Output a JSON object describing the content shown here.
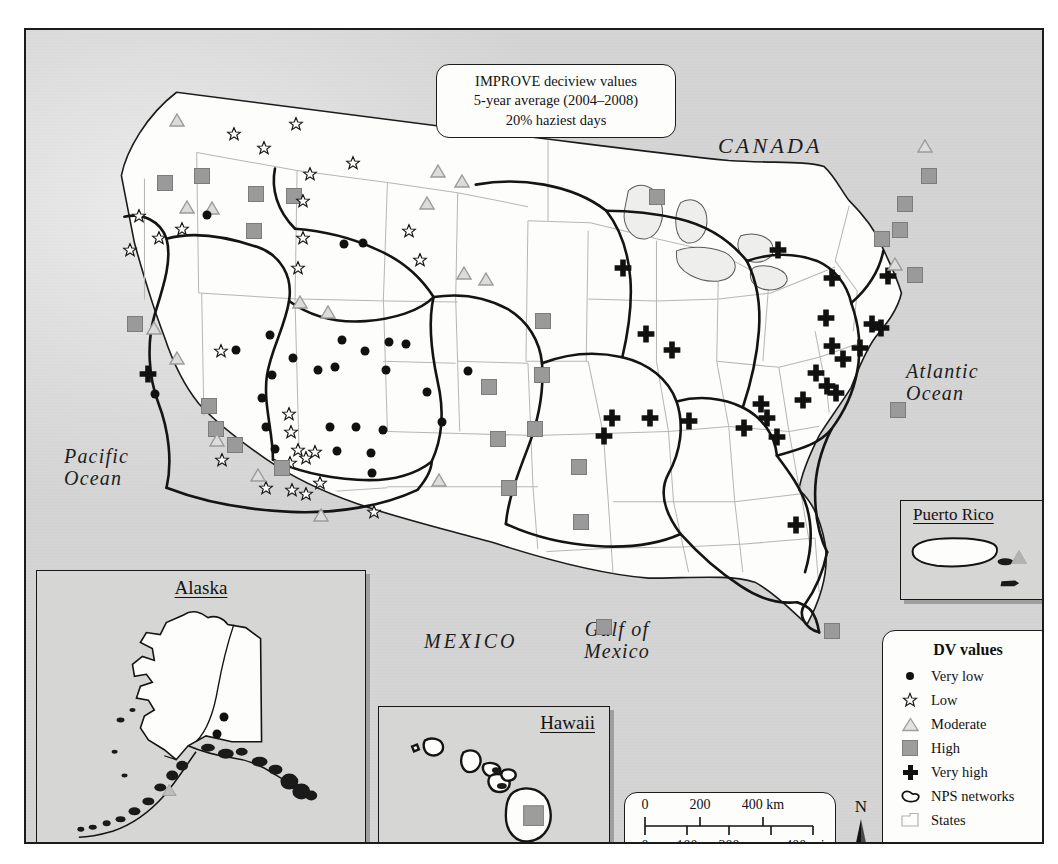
{
  "title_box": {
    "line1": "IMPROVE deciview values",
    "line2": "5-year average (2004–2008)",
    "line3": "20% haziest days"
  },
  "geo_labels": {
    "canada": "CANADA",
    "mexico": "MEXICO",
    "pacific_ocean": "Pacific\nOcean",
    "atlantic_ocean": "Atlantic\nOcean",
    "gulf_of_mexico": "Gulf of\nMexico"
  },
  "insets": {
    "alaska": {
      "title": "Alaska"
    },
    "hawaii": {
      "title": "Hawaii"
    },
    "puerto_rico": {
      "title": "Puerto Rico"
    }
  },
  "legend": {
    "title": "DV values",
    "items": [
      {
        "symbol": "dot-icon",
        "label": "Very low"
      },
      {
        "symbol": "star-icon",
        "label": "Low"
      },
      {
        "symbol": "triangle-icon",
        "label": "Moderate"
      },
      {
        "symbol": "square-icon",
        "label": "High"
      },
      {
        "symbol": "cross-icon",
        "label": "Very high"
      },
      {
        "symbol": "network-outline-icon",
        "label": "NPS networks"
      },
      {
        "symbol": "state-outline-icon",
        "label": "States"
      }
    ]
  },
  "scale_bar": {
    "km_ticks": [
      "0",
      "200",
      "400 km"
    ],
    "mi_ticks": [
      "0",
      "100",
      "200",
      "400 mi"
    ]
  },
  "north_arrow": {
    "label": "N"
  },
  "colors": {
    "very_low": "#111111",
    "low_outline": "#1a1a1a",
    "moderate": "#b2b2b2",
    "high": "#9a9a9a",
    "very_high": "#111111",
    "background": "#d8d8d6",
    "land": "#fdfdfc",
    "nps_network_line": "#151515",
    "state_line": "#b0b0ae"
  },
  "chart_data": {
    "type": "map",
    "categories": [
      "Very low",
      "Low",
      "Moderate",
      "High",
      "Very high"
    ],
    "markers": [
      {
        "c": "sq",
        "x": 139,
        "y": 153
      },
      {
        "c": "sq",
        "x": 176,
        "y": 146
      },
      {
        "c": "tri",
        "x": 151,
        "y": 92
      },
      {
        "c": "star",
        "x": 208,
        "y": 106
      },
      {
        "c": "star",
        "x": 238,
        "y": 120
      },
      {
        "c": "star",
        "x": 270,
        "y": 96
      },
      {
        "c": "star",
        "x": 327,
        "y": 135
      },
      {
        "c": "star",
        "x": 284,
        "y": 146
      },
      {
        "c": "tri",
        "x": 186,
        "y": 180
      },
      {
        "c": "dot",
        "x": 181,
        "y": 185
      },
      {
        "c": "sq",
        "x": 230,
        "y": 164
      },
      {
        "c": "sq",
        "x": 268,
        "y": 166
      },
      {
        "c": "star",
        "x": 277,
        "y": 173
      },
      {
        "c": "tri",
        "x": 412,
        "y": 143
      },
      {
        "c": "tri",
        "x": 436,
        "y": 153
      },
      {
        "c": "tri",
        "x": 401,
        "y": 175
      },
      {
        "c": "sq",
        "x": 228,
        "y": 201
      },
      {
        "c": "star",
        "x": 113,
        "y": 188
      },
      {
        "c": "star",
        "x": 104,
        "y": 222
      },
      {
        "c": "star",
        "x": 133,
        "y": 210
      },
      {
        "c": "tri",
        "x": 161,
        "y": 179
      },
      {
        "c": "star",
        "x": 156,
        "y": 201
      },
      {
        "c": "star",
        "x": 277,
        "y": 210
      },
      {
        "c": "star",
        "x": 272,
        "y": 240
      },
      {
        "c": "star",
        "x": 383,
        "y": 203
      },
      {
        "c": "tri",
        "x": 274,
        "y": 274
      },
      {
        "c": "tri",
        "x": 302,
        "y": 284
      },
      {
        "c": "star",
        "x": 394,
        "y": 232
      },
      {
        "c": "tri",
        "x": 438,
        "y": 245
      },
      {
        "c": "tri",
        "x": 460,
        "y": 251
      },
      {
        "c": "dot",
        "x": 318,
        "y": 214
      },
      {
        "c": "dot",
        "x": 337,
        "y": 213
      },
      {
        "c": "tri",
        "x": 128,
        "y": 300
      },
      {
        "c": "tri",
        "x": 151,
        "y": 330
      },
      {
        "c": "sq",
        "x": 109,
        "y": 294
      },
      {
        "c": "dot",
        "x": 129,
        "y": 364
      },
      {
        "c": "cross",
        "x": 122,
        "y": 346
      },
      {
        "c": "sq",
        "x": 183,
        "y": 376
      },
      {
        "c": "sq",
        "x": 190,
        "y": 399
      },
      {
        "c": "tri",
        "x": 191,
        "y": 412
      },
      {
        "c": "star",
        "x": 195,
        "y": 323
      },
      {
        "c": "dot",
        "x": 210,
        "y": 320
      },
      {
        "c": "dot",
        "x": 244,
        "y": 305
      },
      {
        "c": "dot",
        "x": 246,
        "y": 345
      },
      {
        "c": "dot",
        "x": 267,
        "y": 328
      },
      {
        "c": "dot",
        "x": 292,
        "y": 340
      },
      {
        "c": "dot",
        "x": 309,
        "y": 337
      },
      {
        "c": "dot",
        "x": 316,
        "y": 310
      },
      {
        "c": "dot",
        "x": 339,
        "y": 321
      },
      {
        "c": "dot",
        "x": 363,
        "y": 312
      },
      {
        "c": "dot",
        "x": 360,
        "y": 340
      },
      {
        "c": "dot",
        "x": 380,
        "y": 314
      },
      {
        "c": "star",
        "x": 263,
        "y": 386
      },
      {
        "c": "star",
        "x": 265,
        "y": 404
      },
      {
        "c": "star",
        "x": 272,
        "y": 422
      },
      {
        "c": "star",
        "x": 280,
        "y": 430
      },
      {
        "c": "star",
        "x": 289,
        "y": 424
      },
      {
        "c": "star",
        "x": 264,
        "y": 435
      },
      {
        "c": "sq",
        "x": 256,
        "y": 438
      },
      {
        "c": "star",
        "x": 240,
        "y": 460
      },
      {
        "c": "star",
        "x": 266,
        "y": 462
      },
      {
        "c": "star",
        "x": 280,
        "y": 466
      },
      {
        "c": "star",
        "x": 294,
        "y": 455
      },
      {
        "c": "dot",
        "x": 240,
        "y": 397
      },
      {
        "c": "dot",
        "x": 249,
        "y": 419
      },
      {
        "c": "dot",
        "x": 304,
        "y": 397
      },
      {
        "c": "dot",
        "x": 311,
        "y": 421
      },
      {
        "c": "dot",
        "x": 330,
        "y": 397
      },
      {
        "c": "dot",
        "x": 345,
        "y": 423
      },
      {
        "c": "dot",
        "x": 357,
        "y": 400
      },
      {
        "c": "dot",
        "x": 346,
        "y": 443
      },
      {
        "c": "star",
        "x": 348,
        "y": 484
      },
      {
        "c": "tri",
        "x": 295,
        "y": 487
      },
      {
        "c": "star",
        "x": 196,
        "y": 432
      },
      {
        "c": "sq",
        "x": 209,
        "y": 415
      },
      {
        "c": "tri",
        "x": 232,
        "y": 447
      },
      {
        "c": "dot",
        "x": 236,
        "y": 368
      },
      {
        "c": "dot",
        "x": 401,
        "y": 362
      },
      {
        "c": "dot",
        "x": 416,
        "y": 392
      },
      {
        "c": "tri",
        "x": 413,
        "y": 452
      },
      {
        "c": "dot",
        "x": 442,
        "y": 341
      },
      {
        "c": "sq",
        "x": 517,
        "y": 291
      },
      {
        "c": "sq",
        "x": 463,
        "y": 357
      },
      {
        "c": "sq",
        "x": 516,
        "y": 345
      },
      {
        "c": "sq",
        "x": 509,
        "y": 399
      },
      {
        "c": "sq",
        "x": 472,
        "y": 409
      },
      {
        "c": "sq",
        "x": 483,
        "y": 458
      },
      {
        "c": "sq",
        "x": 553,
        "y": 437
      },
      {
        "c": "sq",
        "x": 555,
        "y": 492
      },
      {
        "c": "sq",
        "x": 578,
        "y": 597
      },
      {
        "c": "sq",
        "x": 631,
        "y": 167
      },
      {
        "c": "cross",
        "x": 597,
        "y": 240
      },
      {
        "c": "cross",
        "x": 620,
        "y": 306
      },
      {
        "c": "cross",
        "x": 646,
        "y": 322
      },
      {
        "c": "cross",
        "x": 586,
        "y": 390
      },
      {
        "c": "cross",
        "x": 578,
        "y": 408
      },
      {
        "c": "cross",
        "x": 624,
        "y": 390
      },
      {
        "c": "cross",
        "x": 663,
        "y": 393
      },
      {
        "c": "cross",
        "x": 718,
        "y": 400
      },
      {
        "c": "cross",
        "x": 741,
        "y": 390
      },
      {
        "c": "cross",
        "x": 752,
        "y": 222
      },
      {
        "c": "cross",
        "x": 806,
        "y": 250
      },
      {
        "c": "cross",
        "x": 862,
        "y": 248
      },
      {
        "c": "cross",
        "x": 800,
        "y": 290
      },
      {
        "c": "cross",
        "x": 846,
        "y": 296
      },
      {
        "c": "cross",
        "x": 806,
        "y": 318
      },
      {
        "c": "cross",
        "x": 817,
        "y": 331
      },
      {
        "c": "cross",
        "x": 790,
        "y": 345
      },
      {
        "c": "cross",
        "x": 801,
        "y": 358
      },
      {
        "c": "cross",
        "x": 834,
        "y": 320
      },
      {
        "c": "cross",
        "x": 855,
        "y": 300
      },
      {
        "c": "cross",
        "x": 777,
        "y": 372
      },
      {
        "c": "cross",
        "x": 810,
        "y": 365
      },
      {
        "c": "cross",
        "x": 735,
        "y": 376
      },
      {
        "c": "cross",
        "x": 751,
        "y": 409
      },
      {
        "c": "cross",
        "x": 770,
        "y": 497
      },
      {
        "c": "sq",
        "x": 879,
        "y": 174
      },
      {
        "c": "sq",
        "x": 903,
        "y": 146
      },
      {
        "c": "sq",
        "x": 874,
        "y": 200
      },
      {
        "c": "tri",
        "x": 899,
        "y": 118
      },
      {
        "c": "tri",
        "x": 869,
        "y": 236
      },
      {
        "c": "sq",
        "x": 856,
        "y": 209
      },
      {
        "c": "sq",
        "x": 889,
        "y": 245
      },
      {
        "c": "sq",
        "x": 872,
        "y": 380
      },
      {
        "c": "sq",
        "x": 806,
        "y": 601
      }
    ]
  }
}
